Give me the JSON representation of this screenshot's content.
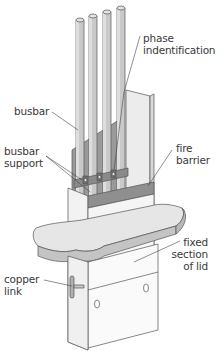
{
  "diagram": {
    "labels": {
      "phase_identification": [
        "phase",
        "indentification"
      ],
      "busbar": [
        "busbar"
      ],
      "busbar_support": [
        "busbar",
        "support"
      ],
      "fire_barrier": [
        "fire",
        "barrier"
      ],
      "fixed_section_of_lid": [
        "fixed",
        "section",
        "of lid"
      ],
      "copper_link": [
        "copper",
        "link"
      ]
    },
    "colors": {
      "busbar_fill": "#c9c9c9",
      "busbar_shade": "#a8a8a8",
      "barrier_dark": "#8f8f8f",
      "panel_light": "#ececec",
      "lid_top": "#e6e6e6",
      "lid_edge": "#c4c4c4",
      "outline": "#555555",
      "text": "#3a3a3a"
    }
  }
}
